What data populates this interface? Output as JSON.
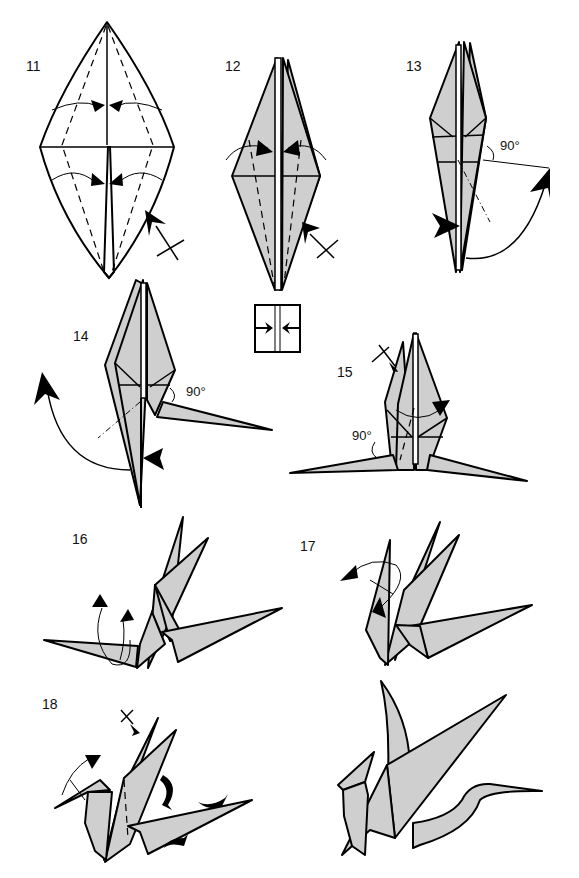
{
  "diagram": {
    "type": "origami instructions",
    "colors": {
      "paper": "#cfcfcf",
      "line": "#000000",
      "background": "#ffffff"
    },
    "steps": [
      {
        "number": "11",
        "symbols": [
          "valley-fold-dashed",
          "fold-in arrows",
          "turn-over/repeat-behind arrow with x"
        ]
      },
      {
        "number": "12",
        "symbols": [
          "valley-fold-dashed",
          "fold-in arrows",
          "repeat-behind arrow with x"
        ]
      },
      {
        "number": "13",
        "angle_label": "90°",
        "symbols": [
          "inside-reverse-fold arrow",
          "mountain-fold dash-dot"
        ]
      },
      {
        "number": "14",
        "angle_label": "90°",
        "symbols": [
          "inside-reverse-fold arrow",
          "mountain-fold dash-dot"
        ]
      },
      {
        "number": "15",
        "angle_label": "90°",
        "symbols": [
          "repeat-behind x arrow",
          "fold arrow"
        ]
      },
      {
        "number": "16",
        "symbols": [
          "crimp arrows"
        ]
      },
      {
        "number": "17",
        "symbols": [
          "reverse-fold arrows"
        ]
      },
      {
        "number": "18",
        "symbols": [
          "x arrow",
          "crimp arrows",
          "curl arrows"
        ]
      },
      {
        "number": "",
        "description": "finished dragon"
      }
    ],
    "inset_symbol": "squash/center arrows in box"
  }
}
